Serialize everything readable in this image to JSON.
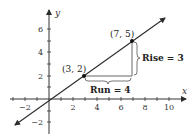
{
  "diagram": {
    "title": "",
    "axes": {
      "x_label": "x",
      "y_label": "y",
      "x_ticks": [
        {
          "label": "−2",
          "value": -2
        },
        {
          "label": "2",
          "value": 2
        },
        {
          "label": "4",
          "value": 4
        },
        {
          "label": "6",
          "value": 6
        },
        {
          "label": "8",
          "value": 8
        },
        {
          "label": "10",
          "value": 10
        }
      ],
      "y_ticks": [
        {
          "label": "6",
          "value": 6
        },
        {
          "label": "4",
          "value": 4
        },
        {
          "label": "2",
          "value": 2
        },
        {
          "label": "−2",
          "value": -2
        }
      ]
    },
    "points": [
      {
        "label": "(3, 2)",
        "x": 3,
        "y": 2
      },
      {
        "label": "(7, 5)",
        "x": 7,
        "y": 5
      }
    ],
    "annotations": {
      "run": "Run = 4",
      "rise": "Rise = 3"
    },
    "colors": {
      "line": "#2b2b2b",
      "axis": "#333333",
      "bracket": "#555555"
    }
  }
}
